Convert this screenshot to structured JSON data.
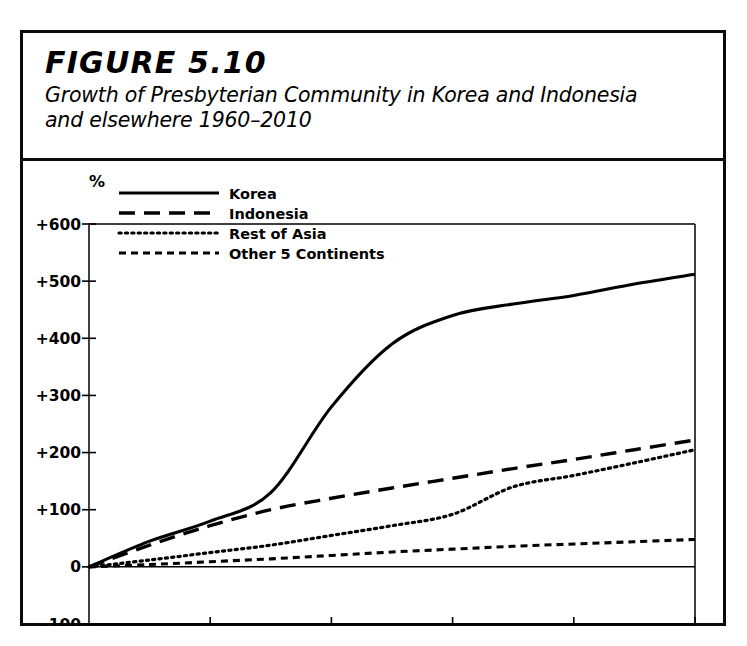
{
  "figure": {
    "label": "FIGURE 5.10",
    "caption_line1": "Growth of Presbyterian Community in Korea and Indonesia",
    "caption_line2": "and elsewhere 1960–2010"
  },
  "chart_data": {
    "type": "line",
    "title": "Growth of Presbyterian Community in Korea and Indonesia and elsewhere 1960–2010",
    "xlabel": "",
    "ylabel": "%",
    "y_unit_label": "%",
    "xlim": [
      1960,
      2010
    ],
    "ylim": [
      -100,
      600
    ],
    "grid": false,
    "legend_position": "top-left",
    "xticks": [
      1960,
      1970,
      1980,
      1990,
      2000,
      2010
    ],
    "xtick_labels": [
      "1960",
      "1970",
      "1980",
      "1990",
      "2000",
      "2010"
    ],
    "yticks": [
      600,
      500,
      400,
      300,
      200,
      100,
      0,
      -100
    ],
    "ytick_labels": [
      "+600",
      "+500",
      "+400",
      "+300",
      "+200",
      "+100",
      "0",
      "-100"
    ],
    "x": [
      1960,
      1965,
      1970,
      1975,
      1980,
      1985,
      1990,
      1995,
      2000,
      2005,
      2010
    ],
    "series": [
      {
        "name": "Korea",
        "style": "solid",
        "values": [
          0,
          45,
          80,
          130,
          280,
          390,
          440,
          460,
          475,
          495,
          512
        ]
      },
      {
        "name": "Indonesia",
        "style": "long-dash",
        "values": [
          0,
          38,
          72,
          100,
          120,
          138,
          155,
          172,
          188,
          205,
          222
        ]
      },
      {
        "name": "Rest of Asia",
        "style": "dotted",
        "values": [
          0,
          12,
          25,
          38,
          55,
          72,
          92,
          140,
          160,
          182,
          205
        ]
      },
      {
        "name": "Other 5 Continents",
        "style": "short-dash",
        "values": [
          0,
          4,
          9,
          14,
          20,
          26,
          31,
          36,
          40,
          44,
          48
        ]
      }
    ]
  },
  "legend": {
    "items": [
      {
        "label": "Korea",
        "style": "solid"
      },
      {
        "label": "Indonesia",
        "style": "long-dash"
      },
      {
        "label": "Rest of Asia",
        "style": "dotted"
      },
      {
        "label": "Other 5 Continents",
        "style": "short-dash"
      }
    ]
  },
  "colors": {
    "ink": "#000000",
    "frame": "#0a0a0a",
    "background": "#ffffff",
    "axis": "#222222"
  }
}
